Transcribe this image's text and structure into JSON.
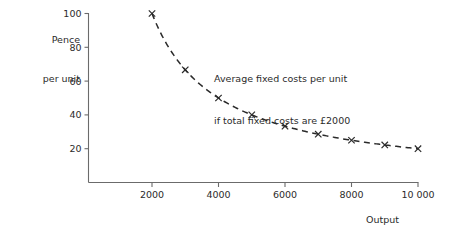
{
  "chart_data": {
    "type": "line",
    "title": "",
    "xlabel": "Output",
    "ylabel_line1": "Pence",
    "ylabel_line2": "per unit",
    "annotation_line1": "Average fixed costs per unit",
    "annotation_line2": "if total fixed costs are £2000",
    "xlim": [
      0,
      11000
    ],
    "ylim": [
      0,
      100
    ],
    "grid": false,
    "legend": "none",
    "xticks": [
      2000,
      4000,
      6000,
      8000,
      10000
    ],
    "xticklabels": [
      "2000",
      "4000",
      "6000",
      "8000",
      "10 000"
    ],
    "yticks": [
      20,
      40,
      60,
      80,
      100
    ],
    "yticklabels": [
      "20",
      "40",
      "60",
      "80",
      "100"
    ],
    "marker": "x",
    "linestyle": "dashed",
    "series": [
      {
        "name": "Average fixed cost per unit",
        "x": [
          2000,
          3000,
          4000,
          5000,
          6000,
          7000,
          8000,
          9000,
          10000
        ],
        "values": [
          100,
          66.7,
          50,
          40,
          33.3,
          28.6,
          25,
          22.2,
          20
        ]
      }
    ],
    "colors": {
      "curve": "#2a2a2a",
      "axis": "#6b6b6b",
      "text": "#2b2b2b",
      "background": "#ffffff"
    }
  }
}
